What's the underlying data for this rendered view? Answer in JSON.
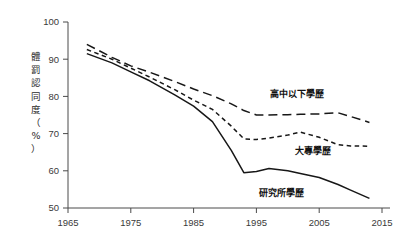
{
  "chart_data": {
    "type": "line",
    "title": "",
    "subtitle": "",
    "xlabel": "",
    "ylabel": "體罰認同度（%）",
    "ylabel_chars": [
      "體",
      "罰",
      "認",
      "同",
      "度",
      "（",
      "%",
      "）"
    ],
    "xlim": [
      1965,
      2015
    ],
    "ylim": [
      50,
      100
    ],
    "xticks": [
      1965,
      1975,
      1985,
      1995,
      2005,
      2015
    ],
    "xtick_labels": [
      "1965",
      "1975",
      "1985",
      "1995",
      "2005",
      "2015"
    ],
    "yticks": [
      50,
      60,
      70,
      80,
      90,
      100
    ],
    "ytick_labels": [
      "50",
      "60",
      "70",
      "80",
      "90",
      "100"
    ],
    "grid": false,
    "legend_position": "inline-annotations",
    "series": [
      {
        "name": "高中以下學歷",
        "style": "long-dash",
        "label_x": 2001.5,
        "label_y": 79.8,
        "x": [
          1968,
          1972,
          1975,
          1978,
          1982,
          1985,
          1988,
          1991,
          1993,
          1995,
          1997,
          2000,
          2002,
          2005,
          2008,
          2010,
          2013
        ],
        "values": [
          94.0,
          90.5,
          88.2,
          86.5,
          84.0,
          82.0,
          80.2,
          78.0,
          76.2,
          75.0,
          75.0,
          75.1,
          75.2,
          75.3,
          75.6,
          74.6,
          73.0
        ]
      },
      {
        "name": "大專學歷",
        "style": "short-dash",
        "label_x": 2004.0,
        "label_y": 64.5,
        "x": [
          1968,
          1972,
          1975,
          1978,
          1982,
          1985,
          1988,
          1991,
          1993,
          1995,
          1997,
          2000,
          2002,
          2005,
          2008,
          2010,
          2013
        ],
        "values": [
          92.6,
          90.0,
          87.6,
          85.2,
          81.8,
          79.0,
          76.5,
          72.0,
          68.6,
          68.4,
          68.8,
          69.6,
          70.4,
          69.0,
          67.0,
          66.7,
          66.6
        ]
      },
      {
        "name": "研究所學歷",
        "style": "solid",
        "label_x": 1999.0,
        "label_y": 53.2,
        "x": [
          1968,
          1972,
          1975,
          1978,
          1982,
          1985,
          1988,
          1991,
          1993,
          1995,
          1997,
          2000,
          2002,
          2005,
          2008,
          2010,
          2013
        ],
        "values": [
          91.5,
          89.0,
          86.6,
          84.2,
          80.4,
          77.4,
          73.2,
          65.5,
          59.5,
          59.8,
          60.6,
          60.0,
          59.3,
          58.2,
          56.3,
          54.8,
          52.6
        ]
      }
    ]
  },
  "colors": {
    "line": "#171717",
    "axis": "#4a4a4a",
    "text": "#2b2b2b",
    "background": "#ffffff"
  }
}
